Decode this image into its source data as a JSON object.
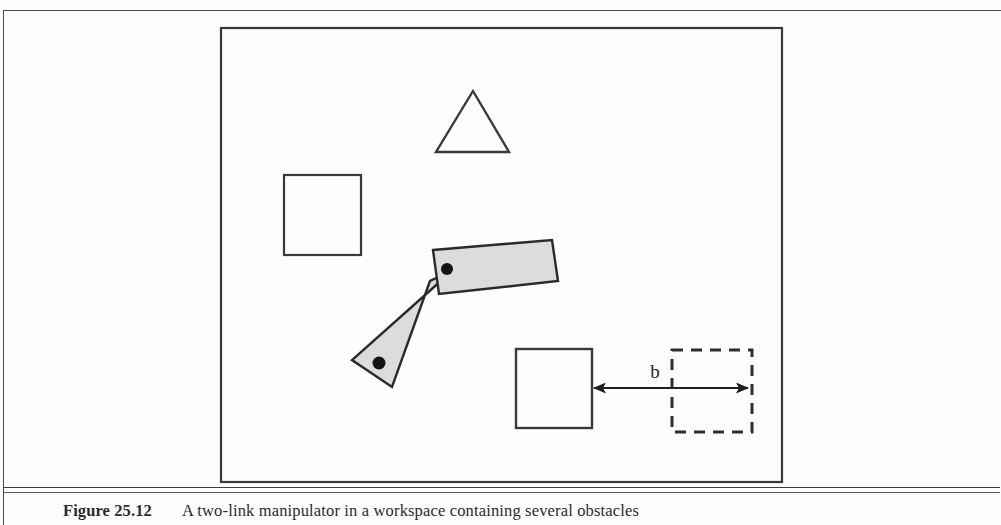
{
  "page": {
    "background_color": "#fdfdfd",
    "frame_color": "#4a4a4a"
  },
  "figure": {
    "title": "Figure 25.12",
    "workspace": {
      "label": "workspace-boundary",
      "x": 221,
      "y": 28,
      "width": 561,
      "height": 454,
      "stroke_color": "#3a3a3a"
    },
    "obstacles": [
      {
        "name": "triangle-obstacle",
        "shape": "triangle",
        "apex": [
          473,
          91
        ],
        "base_left": [
          436,
          152
        ],
        "base_right": [
          509,
          152
        ],
        "stroke_color": "#3a3a3a"
      },
      {
        "name": "square-obstacle-upper-left",
        "shape": "square",
        "x": 284,
        "y": 175,
        "width": 77,
        "height": 80,
        "stroke_color": "#3a3a3a"
      },
      {
        "name": "square-obstacle-lower",
        "shape": "square",
        "x": 516,
        "y": 349,
        "width": 76,
        "height": 79,
        "stroke_color": "#3a3a3a"
      }
    ],
    "goal_region": {
      "name": "dashed-goal-square",
      "shape": "dashed-square",
      "x": 672,
      "y": 350,
      "width": 80,
      "height": 82,
      "stroke_color": "#2e2e2e",
      "dash_pattern": "11 8"
    },
    "dimension": {
      "name": "distance-dimension-b",
      "label": "b",
      "label_x": 655,
      "label_y": 377,
      "arrow_y": 388,
      "arrow_from_x": 592,
      "arrow_to_x": 750,
      "stroke_color": "#1f1f1f"
    },
    "manipulator": {
      "name": "two-link-manipulator",
      "fill_color": "#dcdcdc",
      "stroke_color": "#2a2a2a",
      "link_lower": {
        "name": "link-1-lower-arm",
        "points": "452,271 430,281 392,387 352,360"
      },
      "link_upper": {
        "name": "link-2-upper-arm",
        "points": "433,250 552,240 558,281 439,294"
      },
      "joints": [
        {
          "name": "joint-base",
          "cx": 379,
          "cy": 363,
          "r": 6.5,
          "color": "#141414"
        },
        {
          "name": "joint-elbow",
          "cx": 447,
          "cy": 269,
          "r": 6.0,
          "color": "#141414"
        }
      ]
    }
  },
  "caption": {
    "label": "Figure 25.12",
    "text": "A two-link manipulator in a workspace containing several obstacles"
  }
}
